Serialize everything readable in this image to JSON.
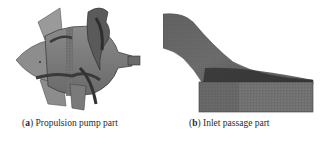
{
  "figures": [
    {
      "label": "a",
      "caption": "Propulsion pump part",
      "image": "propulsion-pump-mesh"
    },
    {
      "label": "b",
      "caption": "Inlet passage part",
      "image": "inlet-passage-mesh"
    }
  ],
  "colors": {
    "mesh_dark": "#3a3a3a",
    "mesh_mid": "#6e6e6e",
    "mesh_light": "#9a9a9a",
    "caption_text": "#2a2a2a"
  }
}
